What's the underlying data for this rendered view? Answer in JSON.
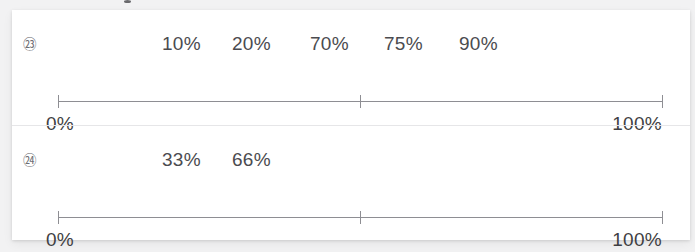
{
  "worksheet": {
    "background_color": "#f2f2f3",
    "sheet_color": "#ffffff",
    "text_color": "#4b4b4f",
    "line_color": "#8e8e93",
    "rows": [
      {
        "item_number": "㉓",
        "item_number_value": "23",
        "values": [
          "10%",
          "20%",
          "70%",
          "75%",
          "90%"
        ],
        "value_positions": [
          0,
          70,
          148,
          222,
          297
        ],
        "scale": {
          "start_label": "0%",
          "end_label": "100%",
          "start_value": 0,
          "end_value": 100,
          "middle_tick_value": 50,
          "ticks": [
            "start",
            "middle",
            "end"
          ]
        }
      },
      {
        "item_number": "㉔",
        "item_number_value": "24",
        "values": [
          "33%",
          "66%"
        ],
        "value_positions": [
          0,
          70
        ],
        "scale": {
          "start_label": "0%",
          "end_label": "100%",
          "start_value": 0,
          "end_value": 100,
          "middle_tick_value": 50,
          "ticks": [
            "start",
            "middle",
            "end"
          ]
        }
      }
    ]
  }
}
